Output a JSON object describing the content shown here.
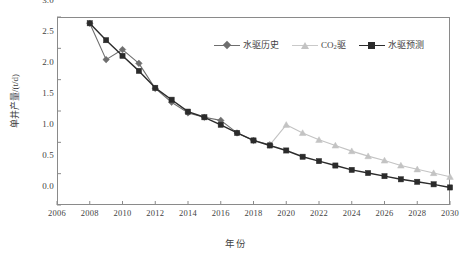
{
  "chart_data": {
    "type": "line",
    "title": "",
    "xlabel": "年份",
    "ylabel": "单井产量/(t/d)",
    "xlim": [
      2006,
      2030
    ],
    "ylim": [
      0.0,
      3.0
    ],
    "xticks": [
      "2006",
      "2008",
      "2010",
      "2012",
      "2014",
      "2016",
      "2018",
      "2020",
      "2022",
      "2024",
      "2026",
      "2028",
      "2030"
    ],
    "yticks": [
      "0.0",
      "0.5",
      "1.0",
      "1.5",
      "2.0",
      "2.5",
      "3.0"
    ],
    "grid": false,
    "legend_position": "top-right-inside",
    "series": [
      {
        "name": "水驱历史",
        "marker": "diamond",
        "color": "#6e6e6e",
        "x": [
          2008,
          2009,
          2010,
          2011,
          2012,
          2013,
          2014,
          2015,
          2016,
          2017,
          2018,
          2019
        ],
        "values": [
          2.9,
          2.32,
          2.48,
          2.26,
          1.86,
          1.64,
          1.47,
          1.4,
          1.35,
          1.15,
          1.03,
          0.96
        ]
      },
      {
        "name": "CO₂驱",
        "marker": "triangle",
        "color": "#c3c3c3",
        "x": [
          2019,
          2020,
          2021,
          2022,
          2023,
          2024,
          2025,
          2026,
          2027,
          2028,
          2029,
          2030
        ],
        "values": [
          0.96,
          1.28,
          1.15,
          1.04,
          0.95,
          0.86,
          0.78,
          0.71,
          0.63,
          0.57,
          0.51,
          0.45
        ]
      },
      {
        "name": "水驱预测",
        "marker": "square",
        "color": "#2b2b2b",
        "x": [
          2008,
          2009,
          2010,
          2011,
          2012,
          2013,
          2014,
          2015,
          2016,
          2017,
          2018,
          2019,
          2020,
          2021,
          2022,
          2023,
          2024,
          2025,
          2026,
          2027,
          2028,
          2029,
          2030
        ],
        "values": [
          2.9,
          2.63,
          2.38,
          2.14,
          1.87,
          1.68,
          1.49,
          1.4,
          1.28,
          1.15,
          1.03,
          0.95,
          0.87,
          0.77,
          0.7,
          0.63,
          0.56,
          0.51,
          0.46,
          0.41,
          0.37,
          0.33,
          0.28
        ]
      }
    ]
  },
  "legend": {
    "items": [
      {
        "label": "水驱历史",
        "marker": "diamond-icon",
        "color": "#6e6e6e"
      },
      {
        "label_main": "CO",
        "label_sub": "2",
        "label_tail": "驱",
        "marker": "triangle-icon",
        "color": "#c3c3c3"
      },
      {
        "label": "水驱预测",
        "marker": "square-icon",
        "color": "#2b2b2b"
      }
    ]
  },
  "axes": {
    "x_title": "年份",
    "y_title": "单井产量/(t/d)"
  }
}
